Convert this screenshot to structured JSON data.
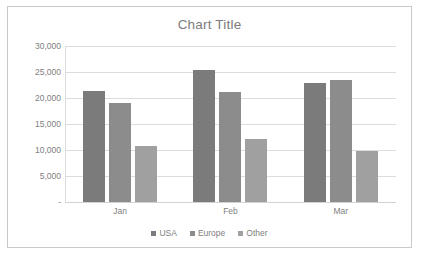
{
  "chart_data": {
    "type": "bar",
    "title": "Chart Title",
    "xlabel": "",
    "ylabel": "",
    "categories": [
      "Jan",
      "Feb",
      "Mar"
    ],
    "series": [
      {
        "name": "USA",
        "color": "#7b7b7b",
        "values": [
          21400,
          25400,
          22800
        ]
      },
      {
        "name": "Europe",
        "color": "#8c8c8c",
        "values": [
          19000,
          21200,
          23500
        ]
      },
      {
        "name": "Other",
        "color": "#a0a0a0",
        "values": [
          10800,
          12200,
          9800
        ]
      }
    ],
    "ylim": [
      0,
      30000
    ],
    "yticks": [
      30000,
      25000,
      20000,
      15000,
      10000,
      5000,
      0
    ],
    "ytick_labels": [
      "30,000",
      "25,000",
      "20,000",
      "15,000",
      "10,000",
      "5,000",
      "-"
    ],
    "grid": true,
    "legend_position": "bottom"
  },
  "style": {
    "border_color": "#c9c9c9",
    "gridline_color": "#dcdcdc",
    "text_color": "#808080",
    "title_color": "#7b7b7b",
    "background": "#ffffff"
  }
}
